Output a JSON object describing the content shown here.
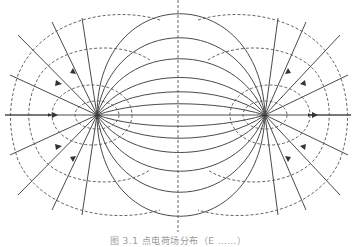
{
  "figure": {
    "type": "electric-dipole-field-diagram",
    "caption": "图 3.1   点电荷场分布（E ……）",
    "charges": [
      {
        "label": "+",
        "name": "positive-charge",
        "x": 97,
        "y": 115
      },
      {
        "label": "−",
        "name": "negative-charge",
        "x": 265,
        "y": 115
      }
    ],
    "symmetry_axis": {
      "style": "dashed",
      "x": 178
    },
    "horizontal_axis": {
      "style": "solid",
      "y": 115
    },
    "legend": {
      "solid_lines": "electric field lines (with arrows)",
      "dashed_lines": "equipotential lines"
    },
    "colors": {
      "line": "#4a4a4a",
      "background": "#ffffff",
      "caption": "#9a9a9a"
    }
  }
}
